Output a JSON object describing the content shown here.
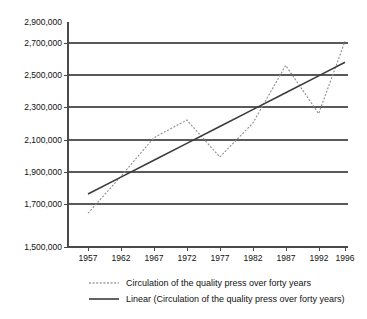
{
  "chart_data": {
    "type": "line",
    "title": "",
    "subtitle": "",
    "xlabel": "",
    "ylabel": "",
    "grid": true,
    "legend_position": "bottom",
    "x": [
      1957,
      1962,
      1967,
      1972,
      1977,
      1982,
      1987,
      1992,
      1996
    ],
    "categories": [
      "1957",
      "1962",
      "1967",
      "1972",
      "1977",
      "1982",
      "1987",
      "1992",
      "1996"
    ],
    "xlim": [
      1955,
      1998
    ],
    "ylim": [
      1500000,
      2900000
    ],
    "ytick_labels": [
      "2,900,000",
      "2,700,000",
      "2,500,000",
      "2,300,000",
      "2,100,000",
      "1,900,000",
      "1,700,000",
      "1,500,000"
    ],
    "ytick_values": [
      2900000,
      2700000,
      2500000,
      2300000,
      2100000,
      1900000,
      1700000,
      1500000
    ],
    "series": [
      {
        "name": "Circulation of the quality press over forty years",
        "style": "dotted",
        "color": "#8e8e8e",
        "values": [
          1710000,
          1940000,
          2180000,
          2290000,
          2060000,
          2270000,
          2630000,
          2330000,
          2780000
        ]
      },
      {
        "name": "Linear (Circulation of the quality press over forty years)",
        "style": "solid",
        "color": "#3b3b3b",
        "values": [
          1830000,
          1935000,
          2040000,
          2145000,
          2250000,
          2355000,
          2460000,
          2565000,
          2650000
        ]
      }
    ],
    "legend": [
      {
        "label": "Circulation of the quality press over forty years",
        "style": "dotted"
      },
      {
        "label": "Linear (Circulation of the quality press over forty years)",
        "style": "solid"
      }
    ]
  }
}
